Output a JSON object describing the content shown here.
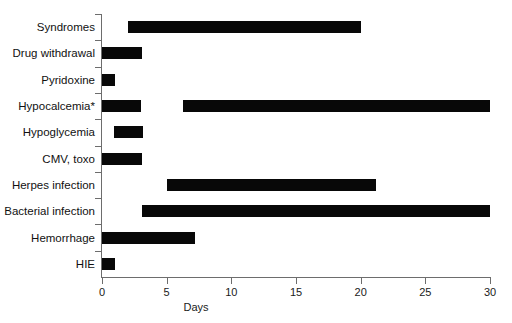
{
  "chart_data": {
    "type": "bar",
    "orientation": "horizontal",
    "title": "",
    "xlabel": "Days",
    "ylabel": "",
    "xlim": [
      0,
      30
    ],
    "xticks": [
      0,
      5,
      10,
      15,
      20,
      25,
      30
    ],
    "xticklabels": [
      "0",
      "5",
      "10",
      "15",
      "20",
      "25",
      "30"
    ],
    "grid": false,
    "legend": "none",
    "bar_color": "#080808",
    "axis_color": "#6d6d6d",
    "note": "Each category is drawn as one or more horizontal spans (start day to end day).",
    "categories": [
      "Syndromes",
      "Drug withdrawal",
      "Pyridoxine",
      "Hypocalcemia*",
      "Hypoglycemia",
      "CMV, toxo",
      "Herpes infection",
      "Bacterial infection",
      "Hemorrhage",
      "HIE"
    ],
    "rows": [
      {
        "label": "Syndromes",
        "spans": [
          {
            "start": 2.0,
            "end": 20.0
          }
        ]
      },
      {
        "label": "Drug withdrawal",
        "spans": [
          {
            "start": 0.0,
            "end": 3.1
          }
        ]
      },
      {
        "label": "Pyridoxine",
        "spans": [
          {
            "start": 0.0,
            "end": 1.0
          }
        ]
      },
      {
        "label": "Hypocalcemia*",
        "spans": [
          {
            "start": 0.0,
            "end": 3.0
          },
          {
            "start": 6.3,
            "end": 30.0
          }
        ]
      },
      {
        "label": "Hypoglycemia",
        "spans": [
          {
            "start": 0.9,
            "end": 3.2
          }
        ]
      },
      {
        "label": "CMV, toxo",
        "spans": [
          {
            "start": 0.0,
            "end": 3.1
          }
        ]
      },
      {
        "label": "Herpes infection",
        "spans": [
          {
            "start": 5.0,
            "end": 21.2
          }
        ]
      },
      {
        "label": "Bacterial infection",
        "spans": [
          {
            "start": 3.1,
            "end": 30.0
          }
        ]
      },
      {
        "label": "Hemorrhage",
        "spans": [
          {
            "start": 0.0,
            "end": 7.2
          }
        ]
      },
      {
        "label": "HIE",
        "spans": [
          {
            "start": 0.0,
            "end": 1.0
          }
        ]
      }
    ]
  }
}
